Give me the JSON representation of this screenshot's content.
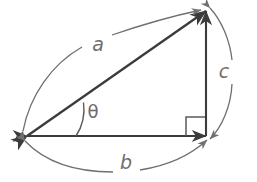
{
  "figure": {
    "type": "right-triangle-diagram",
    "background_color": "#ffffff",
    "colors": {
      "triangle_stroke": "#3b3b3b",
      "arc_stroke": "#6f6f6f",
      "label_fill": "#6e6e6e",
      "right_angle_stroke": "#5a5a5a"
    },
    "vertices": {
      "left": {
        "name": "left-vertex",
        "x": 27,
        "y": 136
      },
      "apex": {
        "name": "apex-vertex",
        "x": 206,
        "y": 11
      },
      "corner": {
        "name": "right-angle-vertex",
        "x": 206,
        "y": 136
      }
    },
    "sides": [
      {
        "id": "hypotenuse",
        "label": "a",
        "from": "left",
        "to": "apex",
        "label_x": 98,
        "label_y": 45
      },
      {
        "id": "base",
        "label": "b",
        "from": "left",
        "to": "corner",
        "label_x": 126,
        "label_y": 163
      },
      {
        "id": "vertical",
        "label": "c",
        "from": "corner",
        "to": "apex",
        "label_x": 224,
        "label_y": 72
      }
    ],
    "angle": {
      "id": "theta",
      "label": "θ",
      "label_x": 93,
      "label_y": 113,
      "at_vertex": "left"
    },
    "right_angle_marker": {
      "id": "right-angle-square",
      "x": 186,
      "y": 117,
      "size": 19
    },
    "measure_arcs": [
      {
        "id": "arc-a",
        "for_side": "a",
        "double_headed": true
      },
      {
        "id": "arc-b",
        "for_side": "b",
        "double_headed": true
      },
      {
        "id": "arc-c",
        "for_side": "c",
        "double_headed": true
      }
    ]
  }
}
